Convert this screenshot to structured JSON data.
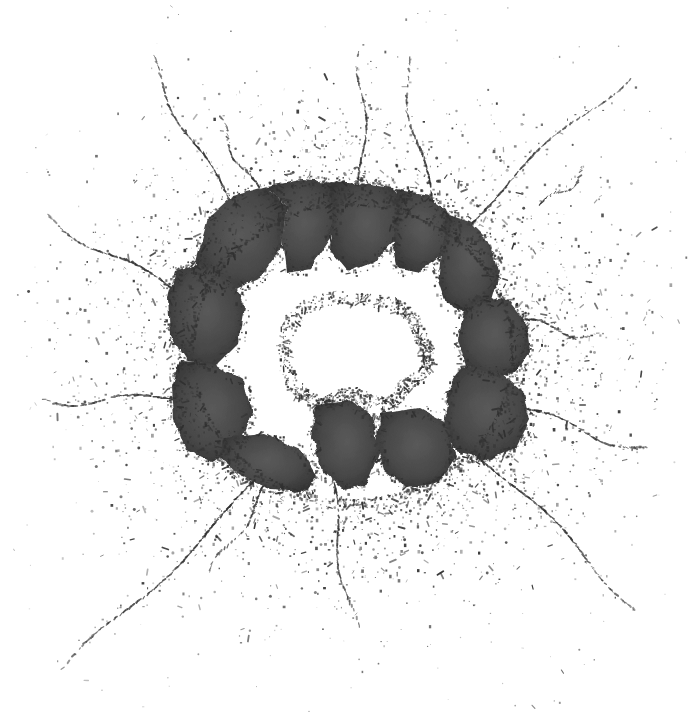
{
  "image": {
    "subject": "shattered glass impact hole",
    "alt_text": "Black and white photograph of a sheet of glass shattered by an impact, with a ragged hole at the center, dark angular shards ringing the hole, and radial cracks and speckled debris spraying outward across a white background",
    "medium": "high-contrast grayscale photograph",
    "width": 689,
    "height": 717,
    "background_color": "#ffffff",
    "shard_fill_color": "#4a4a4a",
    "shard_dark_color": "#333333",
    "crack_seam_color": "#c8c8c8",
    "speckle_color": "#3a3a3a",
    "hole_color": "#ffffff"
  },
  "composition": {
    "impact_center": {
      "x": 352,
      "y": 352
    },
    "hole": {
      "label": "central hole",
      "bounds": {
        "x": 283,
        "y": 298,
        "width": 152,
        "height": 110
      },
      "points": "283,340 292,318 310,303 338,297 366,300 392,303 408,312 418,328 424,344 430,356 428,368 416,378 404,386 398,398 386,404 368,400 352,392 338,398 322,404 306,398 292,382 284,364"
    },
    "shard_mass": {
      "label": "ring of dark glass shards",
      "bounds": {
        "x": 166,
        "y": 178,
        "width": 366,
        "height": 314
      }
    },
    "shards": [
      {
        "id": "shard-upper-left",
        "points": "196,262 208,218 232,196 268,186 286,208 282,246 260,278 228,292 204,286"
      },
      {
        "id": "shard-top-left-center",
        "points": "268,186 302,180 330,182 338,204 330,238 310,268 286,272 282,240 286,208"
      },
      {
        "id": "shard-top-center",
        "points": "330,182 364,184 392,188 404,204 396,238 374,262 348,272 330,250 332,212"
      },
      {
        "id": "shard-top-right",
        "points": "396,190 428,196 446,210 452,230 442,256 420,272 398,268 392,240 400,212"
      },
      {
        "id": "shard-right-upper",
        "points": "446,214 470,222 492,244 500,272 492,300 470,312 446,304 438,280 442,244"
      },
      {
        "id": "shard-right",
        "points": "476,296 508,300 526,322 530,352 516,372 490,378 466,366 458,340 464,312"
      },
      {
        "id": "shard-right-lower",
        "points": "462,366 500,372 524,392 530,420 516,448 488,460 458,452 444,428 448,392"
      },
      {
        "id": "shard-left-upper",
        "points": "176,272 200,264 232,280 244,308 238,344 216,366 188,362 170,334 168,298"
      },
      {
        "id": "shard-left-lower",
        "points": "180,362 214,364 244,382 252,414 240,446 212,462 186,450 174,418 172,386"
      },
      {
        "id": "shard-bottom-left",
        "points": "222,438 264,434 300,450 316,476 306,492 272,490 238,474 220,458"
      },
      {
        "id": "shard-bottom-center",
        "points": "316,404 348,400 372,416 380,452 368,484 344,490 322,470 312,436"
      },
      {
        "id": "shard-bottom-right",
        "points": "380,414 418,408 448,424 456,456 440,482 408,488 384,470 376,442"
      }
    ],
    "inner_cracks": [
      {
        "id": "crack-inner-1",
        "from": {
          "x": 268,
          "y": 186
        },
        "to": {
          "x": 286,
          "y": 272
        }
      },
      {
        "id": "crack-inner-2",
        "from": {
          "x": 330,
          "y": 182
        },
        "to": {
          "x": 332,
          "y": 268
        }
      },
      {
        "id": "crack-inner-3",
        "from": {
          "x": 396,
          "y": 190
        },
        "to": {
          "x": 394,
          "y": 270
        }
      },
      {
        "id": "crack-inner-4",
        "from": {
          "x": 446,
          "y": 212
        },
        "to": {
          "x": 440,
          "y": 286
        }
      },
      {
        "id": "crack-inner-5",
        "from": {
          "x": 196,
          "y": 262
        },
        "to": {
          "x": 284,
          "y": 302
        }
      },
      {
        "id": "crack-inner-6",
        "from": {
          "x": 172,
          "y": 336
        },
        "to": {
          "x": 284,
          "y": 348
        }
      },
      {
        "id": "crack-inner-7",
        "from": {
          "x": 178,
          "y": 396
        },
        "to": {
          "x": 292,
          "y": 382
        }
      },
      {
        "id": "crack-inner-8",
        "from": {
          "x": 222,
          "y": 452
        },
        "to": {
          "x": 310,
          "y": 398
        }
      },
      {
        "id": "crack-inner-9",
        "from": {
          "x": 312,
          "y": 486
        },
        "to": {
          "x": 336,
          "y": 400
        }
      },
      {
        "id": "crack-inner-10",
        "from": {
          "x": 380,
          "y": 486
        },
        "to": {
          "x": 378,
          "y": 404
        }
      },
      {
        "id": "crack-inner-11",
        "from": {
          "x": 452,
          "y": 458
        },
        "to": {
          "x": 402,
          "y": 392
        }
      },
      {
        "id": "crack-inner-12",
        "from": {
          "x": 526,
          "y": 408
        },
        "to": {
          "x": 428,
          "y": 370
        }
      },
      {
        "id": "crack-inner-13",
        "from": {
          "x": 528,
          "y": 344
        },
        "to": {
          "x": 426,
          "y": 346
        }
      },
      {
        "id": "crack-inner-14",
        "from": {
          "x": 496,
          "y": 264
        },
        "to": {
          "x": 418,
          "y": 320
        }
      },
      {
        "id": "crack-inner-arc-1",
        "points": "206,274 248,238 306,212 368,208 420,224 452,252"
      },
      {
        "id": "crack-inner-arc-2",
        "points": "196,324 216,272 266,236 330,226 388,238 428,268 448,302"
      },
      {
        "id": "crack-inner-arc-3",
        "points": "236,424 212,382 214,332 244,294 292,276"
      },
      {
        "id": "crack-inner-arc-4",
        "points": "470,300 492,330 498,372 482,414 452,444"
      },
      {
        "id": "crack-inner-arc-5",
        "points": "300,470 268,438 252,398 256,356"
      },
      {
        "id": "crack-inner-arc-6",
        "points": "408,474 438,446 456,404 454,362"
      }
    ],
    "radial_cracks": [
      {
        "id": "radial-crack-nw-long",
        "label": "upper-left long crack",
        "from": {
          "x": 228,
          "y": 200
        },
        "to": {
          "x": 146,
          "y": 56
        }
      },
      {
        "id": "radial-crack-nnw",
        "label": "upper-left short crack",
        "from": {
          "x": 258,
          "y": 190
        },
        "to": {
          "x": 214,
          "y": 118
        }
      },
      {
        "id": "radial-crack-n",
        "label": "top vertical crack",
        "from": {
          "x": 360,
          "y": 196
        },
        "to": {
          "x": 364,
          "y": 52
        }
      },
      {
        "id": "radial-crack-nne",
        "label": "upper-right crack",
        "from": {
          "x": 432,
          "y": 208
        },
        "to": {
          "x": 402,
          "y": 58
        }
      },
      {
        "id": "radial-crack-ne-long",
        "label": "upper-right long diagonal crack",
        "from": {
          "x": 452,
          "y": 238
        },
        "to": {
          "x": 626,
          "y": 74
        }
      },
      {
        "id": "radial-crack-ne-short",
        "label": "upper-right short fleck crack",
        "from": {
          "x": 540,
          "y": 206
        },
        "to": {
          "x": 588,
          "y": 170
        }
      },
      {
        "id": "radial-crack-e",
        "label": "right horizontal crack",
        "from": {
          "x": 506,
          "y": 318
        },
        "to": {
          "x": 598,
          "y": 336
        }
      },
      {
        "id": "radial-crack-ese",
        "label": "right-lower long crack",
        "from": {
          "x": 516,
          "y": 406
        },
        "to": {
          "x": 648,
          "y": 452
        }
      },
      {
        "id": "radial-crack-se-long",
        "label": "lower-right long diagonal crack",
        "from": {
          "x": 470,
          "y": 446
        },
        "to": {
          "x": 638,
          "y": 606
        }
      },
      {
        "id": "radial-crack-s",
        "label": "bottom vertical crack",
        "from": {
          "x": 330,
          "y": 470
        },
        "to": {
          "x": 352,
          "y": 628
        }
      },
      {
        "id": "radial-crack-sw-long",
        "label": "lower-left long diagonal crack",
        "from": {
          "x": 260,
          "y": 478
        },
        "to": {
          "x": 66,
          "y": 672
        }
      },
      {
        "id": "radial-crack-w",
        "label": "left horizontal crack",
        "from": {
          "x": 182,
          "y": 398
        },
        "to": {
          "x": 44,
          "y": 400
        }
      },
      {
        "id": "radial-crack-wnw",
        "label": "left-upper crack",
        "from": {
          "x": 190,
          "y": 300
        },
        "to": {
          "x": 46,
          "y": 216
        }
      },
      {
        "id": "radial-crack-ssw",
        "label": "lower-left short crack",
        "from": {
          "x": 268,
          "y": 482
        },
        "to": {
          "x": 212,
          "y": 576
        }
      }
    ],
    "debris_field": {
      "label": "speckled glass dust halo",
      "inner_radius": 150,
      "outer_radius": 300,
      "density": "dense near shards, sparse outward"
    }
  },
  "palette": {
    "white": "#ffffff",
    "light_gray": "#c8c8c8",
    "mid_gray": "#7a7a7a",
    "dark_gray": "#4a4a4a",
    "near_black": "#2a2a2a"
  }
}
